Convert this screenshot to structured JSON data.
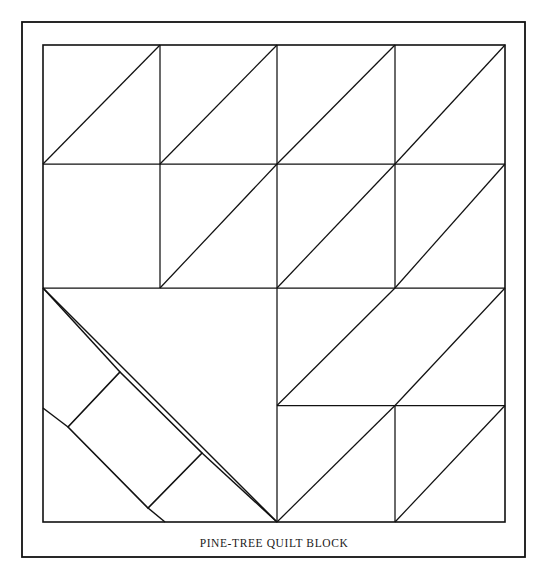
{
  "figure": {
    "caption": "PINE-TREE QUILT BLOCK",
    "title": "Pine-Tree Quilt Block",
    "ink_color": "#111111",
    "background_color": "#ffffff"
  },
  "outer_frame": {
    "name": "outer-frame",
    "x": 22,
    "y": 22,
    "width": 503,
    "height": 535,
    "stroke_width": 1.8
  },
  "block": {
    "name": "quilt-block",
    "x": 43,
    "y": 45,
    "width": 462,
    "height": 477,
    "stroke_width": 1.6,
    "columns": 4,
    "rows": 4,
    "column_x": [
      43,
      158.5,
      274,
      389.5,
      505
    ],
    "row_y": [
      45,
      164,
      283,
      402.5,
      522
    ]
  },
  "grid_lines": {
    "horizontal": [
      {
        "name": "grid-h-1",
        "x1": 43,
        "y1": 164,
        "x2": 505,
        "y2": 164
      },
      {
        "name": "grid-h-2",
        "x1": 43,
        "y1": 288,
        "x2": 505,
        "y2": 288
      },
      {
        "name": "grid-h-3",
        "x1": 277,
        "y1": 405.5,
        "x2": 505,
        "y2": 405.5
      }
    ],
    "vertical": [
      {
        "name": "grid-v-1-top",
        "x1": 160,
        "y1": 45,
        "x2": 160,
        "y2": 288
      },
      {
        "name": "grid-v-2-full",
        "x1": 277,
        "y1": 45,
        "x2": 277,
        "y2": 522
      },
      {
        "name": "grid-v-3-top",
        "x1": 395,
        "y1": 45,
        "x2": 395,
        "y2": 288
      },
      {
        "name": "grid-v-3-bot",
        "x1": 395,
        "y1": 405.5,
        "x2": 395,
        "y2": 522
      }
    ]
  },
  "triangle_diagonals": [
    {
      "name": "hst-r1-c1",
      "x1": 43,
      "y1": 164,
      "x2": 160,
      "y2": 45
    },
    {
      "name": "hst-r1-c2",
      "x1": 160,
      "y1": 164,
      "x2": 277,
      "y2": 45
    },
    {
      "name": "hst-r1-c3",
      "x1": 277,
      "y1": 164,
      "x2": 395,
      "y2": 45
    },
    {
      "name": "hst-r1-c4",
      "x1": 395,
      "y1": 164,
      "x2": 505,
      "y2": 45
    },
    {
      "name": "hst-r2-c2",
      "x1": 160,
      "y1": 288,
      "x2": 277,
      "y2": 164
    },
    {
      "name": "hst-r2-c3",
      "x1": 277,
      "y1": 288,
      "x2": 395,
      "y2": 164
    },
    {
      "name": "hst-r2-c4",
      "x1": 395,
      "y1": 288,
      "x2": 505,
      "y2": 164
    },
    {
      "name": "hst-r3-c3",
      "x1": 277,
      "y1": 405.5,
      "x2": 395,
      "y2": 288
    },
    {
      "name": "hst-r3-c4",
      "x1": 395,
      "y1": 405.5,
      "x2": 505,
      "y2": 288
    },
    {
      "name": "hst-r4-c3",
      "x1": 277,
      "y1": 522,
      "x2": 395,
      "y2": 405.5
    },
    {
      "name": "hst-r4-c4",
      "x1": 395,
      "y1": 522,
      "x2": 505,
      "y2": 405.5
    }
  ],
  "tree_body": {
    "name": "tree-body-triangle",
    "apex": {
      "x": 43,
      "y": 288
    },
    "base_point": {
      "x": 277,
      "y": 522
    },
    "note": "large diagonal forming the pine tree silhouette"
  },
  "trunk": {
    "name": "tree-trunk-rectangle",
    "points": [
      {
        "x": 120,
        "y": 372
      },
      {
        "x": 202,
        "y": 453
      },
      {
        "x": 148,
        "y": 508
      },
      {
        "x": 68,
        "y": 427
      }
    ],
    "support_lines": [
      {
        "name": "trunk-brace-upper-left",
        "x1": 43,
        "y1": 408,
        "x2": 68,
        "y2": 427
      },
      {
        "name": "trunk-brace-lower",
        "x1": 148,
        "y1": 508,
        "x2": 165,
        "y2": 522
      },
      {
        "name": "trunk-brace-right",
        "x1": 202,
        "y1": 453,
        "x2": 277,
        "y2": 522
      },
      {
        "name": "trunk-brace-top",
        "x1": 120,
        "y1": 372,
        "x2": 43,
        "y2": 288
      }
    ]
  },
  "caption_block": {
    "name": "caption",
    "text": "PINE-TREE QUILT BLOCK",
    "x": 274,
    "y": 547
  }
}
